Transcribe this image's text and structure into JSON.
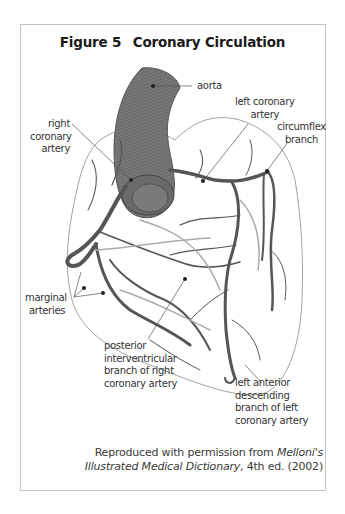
{
  "figure": {
    "number": "Figure 5",
    "title": "Coronary Circulation"
  },
  "labels": {
    "aorta": "aorta",
    "left_coronary_artery": [
      "left coronary",
      "artery"
    ],
    "right_coronary_artery": [
      "right",
      "coronary",
      "artery"
    ],
    "circumflex_branch": [
      "circumflex",
      "branch"
    ],
    "marginal_arteries": [
      "marginal",
      "arteries"
    ],
    "posterior_interventricular": [
      "posterior",
      "interventricular",
      "branch of right",
      "coronary artery"
    ],
    "left_anterior_descending": [
      "left anterior",
      "descending",
      "branch of left",
      "coronary artery"
    ]
  },
  "caption": {
    "line1_prefix": "Reproduced with permission from ",
    "line1_italic": "Melloni's",
    "line2_italic": "Illustrated Medical Dictionary",
    "line2_suffix": ", 4th ed. (2002)"
  },
  "colors": {
    "vessel": "#555555",
    "aorta": "#6e6e6e",
    "outline": "#7a7a7a",
    "border": "#c4c4c4"
  }
}
